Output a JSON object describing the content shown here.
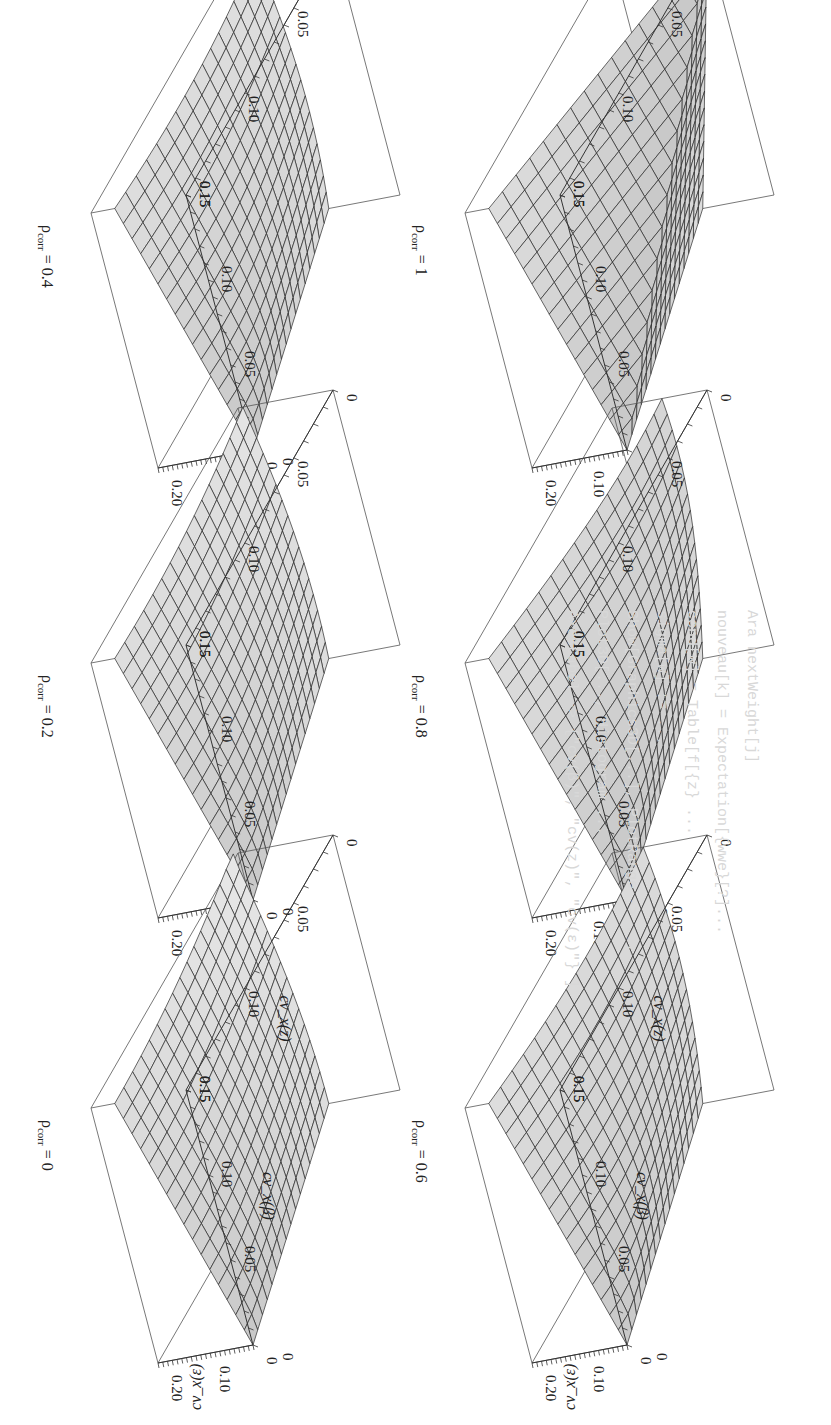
{
  "page": {
    "orientation": "rotated 90 degrees clockwise (scanned book page)",
    "bleed_through_lines": [
      "Ara  nextWeight[j]",
      "nouveau[k] = Expectation[{wwe}[?]...",
      "cond[w] = Table[f[{z} ...",
      "sigma[w] := ...",
      "Show[Graphics3D[...], PlotRange -> ...",
      "   Plot3D[..., Histogram ...",
      "   AxesLabel -> {\"cv(β)\", \"cv(z)\", \"cv(ε)\"} ]"
    ]
  },
  "chart_data": [
    {
      "type": "surface3d",
      "title": "ρ_corr = 0",
      "rho_corr": 0,
      "xlabel": "cv_x(β)",
      "ylabel": "cv_x(z)",
      "zlabel": "cv_x(ε)",
      "x_ticks": [
        "0",
        "0.05",
        "0.10",
        "0.15"
      ],
      "y_ticks": [
        "0",
        "0.05",
        "0.10",
        "0.15"
      ],
      "z_ticks": [
        "0",
        "0.10",
        "0.20"
      ],
      "xlim": [
        0,
        0.15
      ],
      "ylim": [
        0,
        0.15
      ],
      "zlim": [
        0,
        0.2
      ],
      "grid_lines": 16,
      "shape": "smooth plane rising with both cv_x(β) and cv_x(z)",
      "z_at_corners": {
        "x0_y0": 0.0,
        "x015_y0": 0.15,
        "x0_y015": 0.15,
        "x015_y015": 0.21
      }
    },
    {
      "type": "surface3d",
      "title": "ρ_corr = 0.2",
      "rho_corr": 0.2,
      "xlabel": "",
      "ylabel": "",
      "zlabel": "",
      "x_ticks": [
        "0",
        "0.05",
        "0.10",
        "0.15"
      ],
      "y_ticks": [
        "0",
        "0.05",
        "0.10",
        "0.15"
      ],
      "z_ticks": [
        "0",
        "0.10",
        "0.20"
      ],
      "xlim": [
        0,
        0.15
      ],
      "ylim": [
        0,
        0.15
      ],
      "zlim": [
        0,
        0.2
      ],
      "grid_lines": 16,
      "shape": "smooth, slightly curved surface",
      "z_at_corners": {
        "x0_y0": 0.0,
        "x015_y0": 0.15,
        "x0_y015": 0.15,
        "x015_y015": 0.19
      }
    },
    {
      "type": "surface3d",
      "title": "ρ_corr = 0.4",
      "rho_corr": 0.4,
      "xlabel": "",
      "ylabel": "",
      "zlabel": "",
      "x_ticks": [
        "0",
        "0.05",
        "0.10",
        "0.15"
      ],
      "y_ticks": [
        "0",
        "0.05",
        "0.10",
        "0.15"
      ],
      "z_ticks": [
        "0",
        "0.10",
        "0.20"
      ],
      "xlim": [
        0,
        0.15
      ],
      "ylim": [
        0,
        0.15
      ],
      "zlim": [
        0,
        0.2
      ],
      "grid_lines": 16,
      "shape": "curved surface, more concave",
      "z_at_corners": {
        "x0_y0": 0.0,
        "x015_y0": 0.15,
        "x0_y015": 0.15,
        "x015_y015": 0.17
      }
    },
    {
      "type": "surface3d",
      "title": "ρ_corr = 0.6",
      "rho_corr": 0.6,
      "xlabel": "cv_x(β)",
      "ylabel": "cv_x(z)",
      "zlabel": "cv_x(ε)",
      "x_ticks": [
        "0",
        "0.05",
        "0.10",
        "0.15"
      ],
      "y_ticks": [
        "0",
        "0.05",
        "0.10",
        "0.15"
      ],
      "z_ticks": [
        "0",
        "0.10",
        "0.20"
      ],
      "xlim": [
        0,
        0.15
      ],
      "ylim": [
        0,
        0.15
      ],
      "zlim": [
        0,
        0.2
      ],
      "grid_lines": 16,
      "shape": "curved surface with dip along diagonal",
      "z_at_corners": {
        "x0_y0": 0.0,
        "x015_y0": 0.15,
        "x0_y015": 0.15,
        "x015_y015": 0.14
      }
    },
    {
      "type": "surface3d",
      "title": "ρ_corr = 0.8",
      "rho_corr": 0.8,
      "xlabel": "",
      "ylabel": "",
      "zlabel": "",
      "x_ticks": [
        "0",
        "0.05",
        "0.10",
        "0.15"
      ],
      "y_ticks": [
        "0",
        "0.05",
        "0.10",
        "0.15"
      ],
      "z_ticks": [
        "0",
        "0.10",
        "0.20"
      ],
      "xlim": [
        0,
        0.15
      ],
      "ylim": [
        0,
        0.15
      ],
      "zlim": [
        0,
        0.2
      ],
      "grid_lines": 16,
      "shape": "strongly curved surface with valley along diagonal",
      "z_at_corners": {
        "x0_y0": 0.0,
        "x015_y0": 0.15,
        "x0_y015": 0.15,
        "x015_y015": 0.1
      }
    },
    {
      "type": "surface3d",
      "title": "ρ_corr = 1",
      "rho_corr": 1,
      "xlabel": "",
      "ylabel": "",
      "zlabel": "",
      "x_ticks": [
        "0",
        "0.05",
        "0.10",
        "0.15"
      ],
      "y_ticks": [
        "0",
        "0.05",
        "0.10",
        "0.15"
      ],
      "z_ticks": [
        "0",
        "0.10",
        "0.20"
      ],
      "xlim": [
        0,
        0.15
      ],
      "ylim": [
        0,
        0.15
      ],
      "zlim": [
        0,
        0.2
      ],
      "grid_lines": 16,
      "shape": "V-shaped surface = |cv(β) - cv(z)|, zero along diagonal",
      "z_at_corners": {
        "x0_y0": 0.0,
        "x015_y0": 0.15,
        "x0_y015": 0.15,
        "x015_y015": 0.0
      }
    }
  ],
  "layout": {
    "panel_order_on_screen": [
      {
        "chart": 2,
        "col": 0,
        "row": 0
      },
      {
        "chart": 5,
        "col": 1,
        "row": 0
      },
      {
        "chart": 1,
        "col": 0,
        "row": 1
      },
      {
        "chart": 4,
        "col": 1,
        "row": 1
      },
      {
        "chart": 0,
        "col": 0,
        "row": 2
      },
      {
        "chart": 3,
        "col": 1,
        "row": 2
      }
    ],
    "colors": {
      "surface_fill": "#c8c8c8",
      "surface_fill_light": "#e2e2e2",
      "grid": "#2a2a2a",
      "box": "#555555",
      "text": "#222222",
      "bleed": "#d6d6d6"
    }
  }
}
